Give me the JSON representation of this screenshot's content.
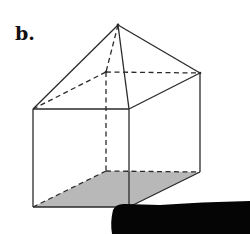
{
  "figure": {
    "label": "b.",
    "colors": {
      "line": "#2a2a2a",
      "base_fill": "#b8b8b8",
      "smudge": "#050505",
      "background": "#ffffff"
    },
    "vertices": {
      "apex": [
        118,
        25
      ],
      "top_front_left": [
        33,
        109
      ],
      "top_front_right": [
        129,
        109
      ],
      "top_back_right": [
        200,
        73
      ],
      "top_back_left": [
        106,
        72
      ],
      "bottom_front_left": [
        33,
        207
      ],
      "bottom_front_right": [
        129,
        207
      ],
      "bottom_back_right": [
        200,
        172
      ],
      "bottom_back_left": [
        106,
        171
      ]
    }
  }
}
